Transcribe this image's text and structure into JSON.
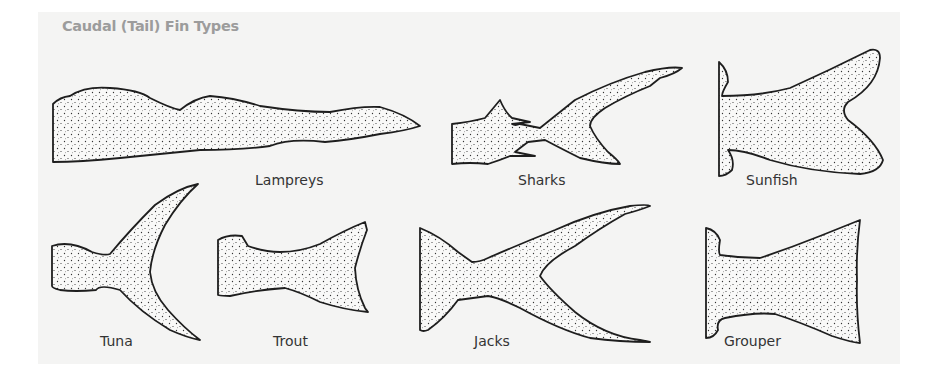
{
  "title": "Caudal (Tail) Fin Types",
  "fins": [
    {
      "id": "lampreys",
      "label": "Lampreys"
    },
    {
      "id": "sharks",
      "label": "Sharks"
    },
    {
      "id": "sunfish",
      "label": "Sunfish"
    },
    {
      "id": "tuna",
      "label": "Tuna"
    },
    {
      "id": "trout",
      "label": "Trout"
    },
    {
      "id": "jacks",
      "label": "Jacks"
    },
    {
      "id": "grouper",
      "label": "Grouper"
    }
  ],
  "colors": {
    "background": "#f4f4f3",
    "title": "#9c9c9c",
    "ink": "#222222",
    "label": "#333333"
  }
}
